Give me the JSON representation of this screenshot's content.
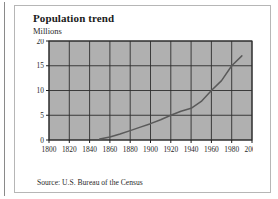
{
  "figure": {
    "title": "Population trend",
    "unit_label": "Millions",
    "source": "Source: U.S. Bureau of the Census"
  },
  "colors": {
    "plot_background": "#b0b0b0",
    "gridline": "#2e2e2e",
    "series_line": "#5a5a5a",
    "card_border": "#b6b6b6",
    "text": "#1b1b1b",
    "page_background": "#ffffff"
  },
  "chart_data": {
    "type": "line",
    "title": "Population trend",
    "subtitle": "Millions",
    "xlabel": "",
    "ylabel": "Millions",
    "xlim": [
      1800,
      2000
    ],
    "ylim": [
      0,
      20
    ],
    "grid": true,
    "legend": "none",
    "xticks": [
      1800,
      1820,
      1840,
      1860,
      1880,
      1900,
      1920,
      1940,
      1960,
      1980,
      2000
    ],
    "yticks": [
      0,
      5,
      10,
      15,
      20
    ],
    "xtick_labels": [
      "1800",
      "1820",
      "1840",
      "1860",
      "1880",
      "1900",
      "1920",
      "1940",
      "1960",
      "1980",
      "2000"
    ],
    "ytick_labels": [
      "0",
      "5",
      "10",
      "15",
      "20"
    ],
    "series": [
      {
        "name": "Population",
        "x": [
          1850,
          1860,
          1870,
          1880,
          1890,
          1900,
          1910,
          1920,
          1930,
          1940,
          1950,
          1960,
          1970,
          1980,
          1990
        ],
        "values": [
          0.2,
          0.6,
          1.2,
          1.9,
          2.6,
          3.3,
          4.1,
          5.0,
          5.8,
          6.4,
          7.8,
          10.0,
          12.0,
          15.0,
          17.0
        ]
      }
    ]
  }
}
